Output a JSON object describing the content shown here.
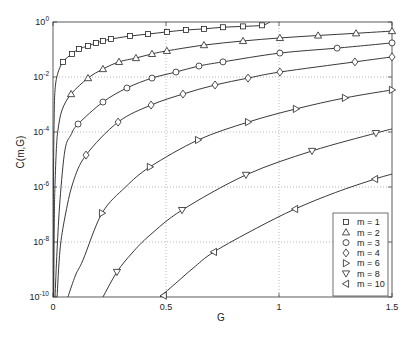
{
  "chart_data": {
    "type": "line",
    "title": "",
    "xlabel": "G",
    "ylabel": "C(m,G)",
    "xlim": [
      0,
      1.5
    ],
    "ylim": [
      1e-10,
      1
    ],
    "ylim_log10": [
      -10,
      0
    ],
    "yscale": "log",
    "y_encoding": "points are [G, log10(C)]",
    "grid": true,
    "legend_position": "lower right",
    "x_ticks": [
      {
        "value": 0,
        "label": "0"
      },
      {
        "value": 0.5,
        "label": "0.5"
      },
      {
        "value": 1,
        "label": "1"
      },
      {
        "value": 1.5,
        "label": "1.5"
      }
    ],
    "y_ticks": [
      {
        "log10": 0,
        "base": "10",
        "exp": "0"
      },
      {
        "log10": -2,
        "base": "10",
        "exp": "-2"
      },
      {
        "log10": -4,
        "base": "10",
        "exp": "-4"
      },
      {
        "log10": -6,
        "base": "10",
        "exp": "-6"
      },
      {
        "log10": -8,
        "base": "10",
        "exp": "-8"
      },
      {
        "log10": -10,
        "base": "10",
        "exp": "-10"
      }
    ],
    "series": [
      {
        "name": "m = 1",
        "m": 1,
        "marker": "square",
        "points": [
          [
            0.001,
            -10
          ],
          [
            0.002,
            -6
          ],
          [
            0.005,
            -3.5
          ],
          [
            0.009,
            -2.47
          ],
          [
            0.02,
            -1.9
          ],
          [
            0.044,
            -1.45
          ],
          [
            0.084,
            -1.16
          ],
          [
            0.115,
            -0.98
          ],
          [
            0.155,
            -0.87
          ],
          [
            0.19,
            -0.76
          ],
          [
            0.221,
            -0.69
          ],
          [
            0.257,
            -0.62
          ],
          [
            0.341,
            -0.51
          ],
          [
            0.42,
            -0.44
          ],
          [
            0.504,
            -0.36
          ],
          [
            0.588,
            -0.29
          ],
          [
            0.668,
            -0.25
          ],
          [
            0.752,
            -0.19
          ],
          [
            0.841,
            -0.16
          ],
          [
            0.925,
            -0.12
          ],
          [
            0.96,
            0
          ]
        ],
        "marker_points": [
          [
            0.044,
            -1.45
          ],
          [
            0.084,
            -1.16
          ],
          [
            0.115,
            -0.98
          ],
          [
            0.155,
            -0.87
          ],
          [
            0.19,
            -0.76
          ],
          [
            0.221,
            -0.69
          ],
          [
            0.257,
            -0.62
          ],
          [
            0.341,
            -0.51
          ],
          [
            0.42,
            -0.44
          ],
          [
            0.504,
            -0.36
          ],
          [
            0.588,
            -0.29
          ],
          [
            0.668,
            -0.25
          ],
          [
            0.752,
            -0.19
          ],
          [
            0.841,
            -0.16
          ],
          [
            0.925,
            -0.12
          ]
        ]
      },
      {
        "name": "m = 2",
        "m": 2,
        "marker": "triangle-up",
        "points": [
          [
            0.003,
            -10
          ],
          [
            0.006,
            -7
          ],
          [
            0.009,
            -5.9
          ],
          [
            0.015,
            -4.6
          ],
          [
            0.022,
            -3.93
          ],
          [
            0.04,
            -3.2
          ],
          [
            0.08,
            -2.62
          ],
          [
            0.155,
            -2.04
          ],
          [
            0.221,
            -1.71
          ],
          [
            0.292,
            -1.45
          ],
          [
            0.367,
            -1.31
          ],
          [
            0.438,
            -1.16
          ],
          [
            0.504,
            -1.05
          ],
          [
            0.668,
            -0.84
          ],
          [
            0.841,
            -0.69
          ],
          [
            1.004,
            -0.58
          ],
          [
            1.173,
            -0.49
          ],
          [
            1.341,
            -0.41
          ],
          [
            1.5,
            -0.33
          ]
        ],
        "marker_points": [
          [
            0.08,
            -2.62
          ],
          [
            0.155,
            -2.04
          ],
          [
            0.221,
            -1.71
          ],
          [
            0.292,
            -1.45
          ],
          [
            0.367,
            -1.31
          ],
          [
            0.438,
            -1.16
          ],
          [
            0.504,
            -1.05
          ],
          [
            0.668,
            -0.84
          ],
          [
            0.841,
            -0.69
          ],
          [
            1.004,
            -0.58
          ],
          [
            1.173,
            -0.49
          ],
          [
            1.341,
            -0.41
          ],
          [
            1.5,
            -0.33
          ]
        ]
      },
      {
        "name": "m = 3",
        "m": 3,
        "marker": "circle",
        "points": [
          [
            0.009,
            -10
          ],
          [
            0.018,
            -8.29
          ],
          [
            0.031,
            -6.47
          ],
          [
            0.053,
            -4.65
          ],
          [
            0.08,
            -4.1
          ],
          [
            0.111,
            -3.71
          ],
          [
            0.221,
            -2.91
          ],
          [
            0.327,
            -2.4
          ],
          [
            0.438,
            -2.04
          ],
          [
            0.544,
            -1.82
          ],
          [
            0.646,
            -1.6
          ],
          [
            0.752,
            -1.45
          ],
          [
            1.004,
            -1.13
          ],
          [
            1.257,
            -0.95
          ],
          [
            1.5,
            -0.76
          ]
        ],
        "marker_points": [
          [
            0.111,
            -3.71
          ],
          [
            0.221,
            -2.91
          ],
          [
            0.327,
            -2.4
          ],
          [
            0.438,
            -2.04
          ],
          [
            0.544,
            -1.82
          ],
          [
            0.646,
            -1.6
          ],
          [
            0.752,
            -1.45
          ],
          [
            1.004,
            -1.13
          ],
          [
            1.257,
            -0.95
          ],
          [
            1.5,
            -0.76
          ]
        ]
      },
      {
        "name": "m = 4",
        "m": 4,
        "marker": "diamond",
        "points": [
          [
            0.018,
            -10
          ],
          [
            0.031,
            -8.29
          ],
          [
            0.053,
            -7.09
          ],
          [
            0.088,
            -5.85
          ],
          [
            0.146,
            -4.84
          ],
          [
            0.288,
            -3.64
          ],
          [
            0.434,
            -3.02
          ],
          [
            0.575,
            -2.62
          ],
          [
            0.717,
            -2.29
          ],
          [
            0.863,
            -2.04
          ],
          [
            1.004,
            -1.82
          ],
          [
            1.336,
            -1.45
          ],
          [
            1.5,
            -1.27
          ]
        ],
        "marker_points": [
          [
            0.146,
            -4.84
          ],
          [
            0.288,
            -3.64
          ],
          [
            0.434,
            -3.02
          ],
          [
            0.575,
            -2.62
          ],
          [
            0.717,
            -2.29
          ],
          [
            0.863,
            -2.04
          ],
          [
            1.004,
            -1.82
          ],
          [
            1.336,
            -1.45
          ],
          [
            1.5,
            -1.27
          ]
        ]
      },
      {
        "name": "m = 6",
        "m": 6,
        "marker": "triangle-right",
        "points": [
          [
            0.066,
            -10
          ],
          [
            0.1,
            -9.2
          ],
          [
            0.133,
            -8.65
          ],
          [
            0.217,
            -6.95
          ],
          [
            0.321,
            -6.0
          ],
          [
            0.429,
            -5.27
          ],
          [
            0.642,
            -4.29
          ],
          [
            0.863,
            -3.64
          ],
          [
            1.075,
            -3.16
          ],
          [
            1.292,
            -2.76
          ],
          [
            1.5,
            -2.47
          ]
        ],
        "marker_points": [
          [
            0.217,
            -6.95
          ],
          [
            0.429,
            -5.27
          ],
          [
            0.642,
            -4.29
          ],
          [
            0.863,
            -3.64
          ],
          [
            1.075,
            -3.16
          ],
          [
            1.292,
            -2.76
          ],
          [
            1.5,
            -2.47
          ]
        ]
      },
      {
        "name": "m = 8",
        "m": 8,
        "marker": "triangle-down",
        "points": [
          [
            0.221,
            -10
          ],
          [
            0.283,
            -9.09
          ],
          [
            0.35,
            -8.4
          ],
          [
            0.429,
            -7.75
          ],
          [
            0.571,
            -6.84
          ],
          [
            0.854,
            -5.56
          ],
          [
            1.146,
            -4.69
          ],
          [
            1.429,
            -4.04
          ],
          [
            1.5,
            -3.89
          ]
        ],
        "marker_points": [
          [
            0.283,
            -9.09
          ],
          [
            0.571,
            -6.84
          ],
          [
            0.854,
            -5.56
          ],
          [
            1.146,
            -4.69
          ],
          [
            1.429,
            -4.04
          ]
        ]
      },
      {
        "name": "m = 10",
        "m": 10,
        "marker": "triangle-left",
        "points": [
          [
            0.473,
            -10
          ],
          [
            0.55,
            -9.45
          ],
          [
            0.62,
            -8.95
          ],
          [
            0.712,
            -8.36
          ],
          [
            0.9,
            -7.5
          ],
          [
            1.071,
            -6.8
          ],
          [
            1.25,
            -6.2
          ],
          [
            1.425,
            -5.71
          ],
          [
            1.5,
            -5.53
          ]
        ],
        "marker_points": [
          [
            0.49,
            -9.95
          ],
          [
            0.712,
            -8.36
          ],
          [
            1.071,
            -6.8
          ],
          [
            1.425,
            -5.71
          ]
        ]
      }
    ]
  },
  "colors": {
    "line": "#222222",
    "axis": "#333333",
    "grid": "#8a8a8a",
    "marker_fill": "#ffffff",
    "background": "#ffffff"
  }
}
